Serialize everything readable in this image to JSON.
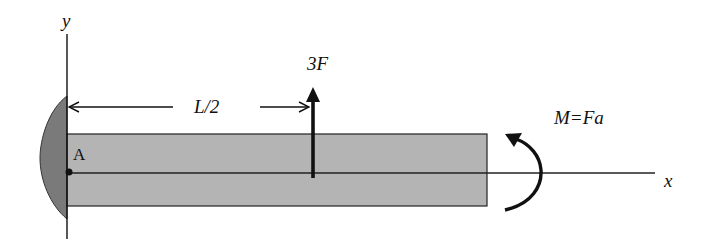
{
  "diagram": {
    "colors": {
      "beam_fill": "#b4b4b4",
      "wall_fill": "#7a7a7a",
      "line": "#111111",
      "background": "#ffffff"
    },
    "axes": {
      "x_label": "x",
      "y_label": "y"
    },
    "support": {
      "type": "fixed-wall",
      "point_label": "A"
    },
    "dimension": {
      "label": "L/2"
    },
    "force": {
      "label": "3F",
      "direction": "up",
      "position": "L/2"
    },
    "moment": {
      "label": "M=Fa",
      "direction": "counter-clockwise",
      "position": "free end"
    }
  }
}
